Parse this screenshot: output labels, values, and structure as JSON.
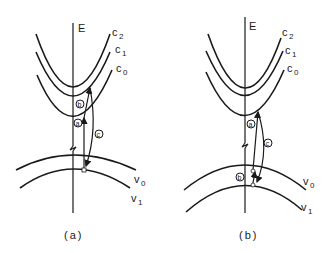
{
  "figure": {
    "panels": [
      {
        "id": "a",
        "caption": "(a)",
        "axis_label": "E",
        "conduction_bands": [
          {
            "label": "c",
            "sub": "2"
          },
          {
            "label": "c",
            "sub": "1"
          },
          {
            "label": "c",
            "sub": "0"
          }
        ],
        "valence_bands": [
          {
            "label": "v",
            "sub": "0"
          },
          {
            "label": "v",
            "sub": "1"
          }
        ],
        "transitions": [
          {
            "label": "a"
          },
          {
            "label": "b"
          },
          {
            "label": "c"
          }
        ]
      },
      {
        "id": "b",
        "caption": "(b)",
        "axis_label": "E",
        "conduction_bands": [
          {
            "label": "c",
            "sub": "2"
          },
          {
            "label": "c",
            "sub": "1"
          },
          {
            "label": "c",
            "sub": "0"
          }
        ],
        "valence_bands": [
          {
            "label": "v",
            "sub": "0"
          },
          {
            "label": "v",
            "sub": "1"
          }
        ],
        "transitions": [
          {
            "label": "a"
          },
          {
            "label": "b"
          },
          {
            "label": "c"
          }
        ]
      }
    ],
    "colors": {
      "ink": "#1a1a1a",
      "background": "#ffffff"
    }
  }
}
